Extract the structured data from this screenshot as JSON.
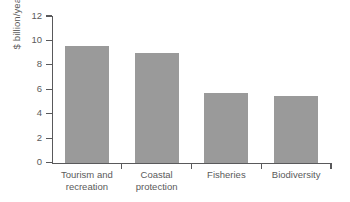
{
  "chart_data": {
    "type": "bar",
    "title": "",
    "xlabel": "",
    "ylabel": "$ billion/year",
    "categories": [
      "Tourism and recreation",
      "Coastal protection",
      "Fisheries",
      "Biodiversity"
    ],
    "category_lines": [
      [
        "Tourism and",
        "recreation"
      ],
      [
        "Coastal",
        "protection"
      ],
      [
        "Fisheries"
      ],
      [
        "Biodiversity"
      ]
    ],
    "values": [
      9.6,
      9.0,
      5.7,
      5.5
    ],
    "ylim": [
      0,
      12
    ],
    "yticks": [
      0,
      2,
      4,
      6,
      8,
      10,
      12
    ],
    "ytick_labels": [
      "0",
      "2",
      "4",
      "6",
      "8",
      "10",
      "12"
    ],
    "grid": false,
    "legend": false,
    "bar_color": "#9a9a9a",
    "axis_color": "#59595b",
    "background": "#ffffff"
  }
}
